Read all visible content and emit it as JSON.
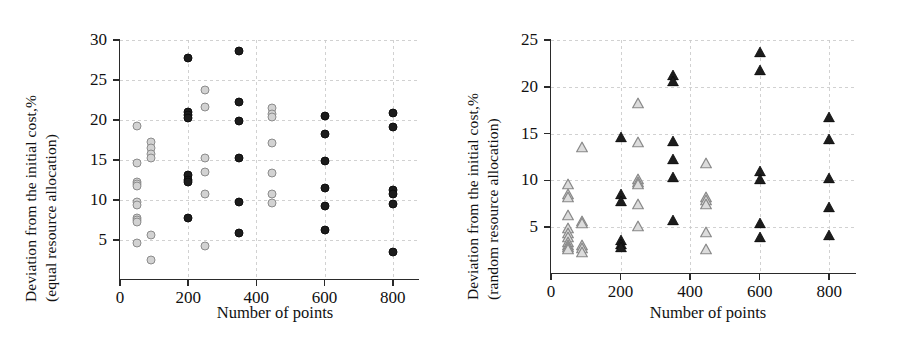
{
  "figure": {
    "panels": [
      {
        "id": "left",
        "ylabel_line1": "Deviation from the initial cost,%",
        "ylabel_line2": "(equal resource allocation)",
        "xlabel": "Number of points",
        "yticks": [
          "30",
          "25",
          "20",
          "15",
          "10",
          "5"
        ],
        "xticks": [
          "0",
          "200",
          "400",
          "600",
          "800"
        ]
      },
      {
        "id": "right",
        "ylabel_line1": "Deviation from the initial cost,%",
        "ylabel_line2": "(random resource allocation)",
        "xlabel": "Number of points",
        "yticks": [
          "25",
          "20",
          "15",
          "10",
          "5"
        ],
        "xticks": [
          "0",
          "200",
          "400",
          "600",
          "800"
        ]
      }
    ]
  },
  "chart_data": [
    {
      "type": "scatter",
      "title": "",
      "panel": "left",
      "xlabel": "Number of points",
      "ylabel": "Deviation from the initial cost,% (equal resource allocation)",
      "xlim": [
        0,
        880
      ],
      "ylim": [
        0,
        30
      ],
      "xticks": [
        0,
        200,
        400,
        600,
        800
      ],
      "yticks": [
        5,
        10,
        15,
        20,
        25,
        30
      ],
      "grid": true,
      "legend": false,
      "series": [
        {
          "name": "light-circles",
          "marker": "open-circle",
          "color": "#d2d2d2",
          "edge_color": "#8c8c8c",
          "points": [
            [
              50,
              19.2
            ],
            [
              50,
              14.6
            ],
            [
              50,
              12.3
            ],
            [
              50,
              12.0
            ],
            [
              50,
              11.8
            ],
            [
              50,
              9.7
            ],
            [
              50,
              9.4
            ],
            [
              50,
              7.8
            ],
            [
              50,
              7.5
            ],
            [
              50,
              7.3
            ],
            [
              50,
              4.6
            ],
            [
              90,
              17.2
            ],
            [
              90,
              16.5
            ],
            [
              90,
              15.8
            ],
            [
              90,
              15.3
            ],
            [
              90,
              5.6
            ],
            [
              90,
              2.5
            ],
            [
              250,
              23.8
            ],
            [
              250,
              21.6
            ],
            [
              250,
              15.3
            ],
            [
              250,
              13.5
            ],
            [
              250,
              10.7
            ],
            [
              250,
              4.2
            ],
            [
              445,
              21.5
            ],
            [
              445,
              20.7
            ],
            [
              445,
              20.4
            ],
            [
              445,
              17.1
            ],
            [
              445,
              13.4
            ],
            [
              445,
              10.7
            ],
            [
              445,
              9.6
            ]
          ]
        },
        {
          "name": "dark-circles",
          "marker": "filled-circle",
          "color": "#1c1c1c",
          "points": [
            [
              200,
              27.7
            ],
            [
              200,
              21.0
            ],
            [
              200,
              20.6
            ],
            [
              200,
              20.3
            ],
            [
              200,
              13.1
            ],
            [
              200,
              12.5
            ],
            [
              200,
              12.2
            ],
            [
              200,
              7.7
            ],
            [
              350,
              28.6
            ],
            [
              350,
              22.2
            ],
            [
              350,
              19.9
            ],
            [
              350,
              15.3
            ],
            [
              350,
              9.8
            ],
            [
              350,
              5.9
            ],
            [
              600,
              20.5
            ],
            [
              600,
              18.2
            ],
            [
              600,
              14.9
            ],
            [
              600,
              11.5
            ],
            [
              600,
              9.3
            ],
            [
              600,
              6.3
            ],
            [
              800,
              20.9
            ],
            [
              800,
              19.1
            ],
            [
              800,
              11.3
            ],
            [
              800,
              10.8
            ],
            [
              800,
              9.5
            ],
            [
              800,
              3.5
            ]
          ]
        }
      ]
    },
    {
      "type": "scatter",
      "title": "",
      "panel": "right",
      "xlabel": "Number of points",
      "ylabel": "Deviation from the initial cost,% (random resource allocation)",
      "xlim": [
        0,
        880
      ],
      "ylim": [
        0,
        25
      ],
      "xticks": [
        0,
        200,
        400,
        600,
        800
      ],
      "yticks": [
        5,
        10,
        15,
        20,
        25
      ],
      "grid": true,
      "legend": false,
      "series": [
        {
          "name": "light-triangles",
          "marker": "open-triangle",
          "color": "#d4d4d4",
          "edge_color": "#8c8c8c",
          "points": [
            [
              50,
              9.6
            ],
            [
              50,
              8.5
            ],
            [
              50,
              8.2
            ],
            [
              50,
              6.3
            ],
            [
              50,
              4.9
            ],
            [
              50,
              4.4
            ],
            [
              50,
              3.9
            ],
            [
              50,
              3.4
            ],
            [
              50,
              3.1
            ],
            [
              50,
              2.9
            ],
            [
              50,
              2.7
            ],
            [
              90,
              13.6
            ],
            [
              90,
              5.7
            ],
            [
              90,
              5.4
            ],
            [
              90,
              3.1
            ],
            [
              90,
              2.8
            ],
            [
              90,
              2.3
            ],
            [
              250,
              18.3
            ],
            [
              250,
              14.1
            ],
            [
              250,
              10.2
            ],
            [
              250,
              9.8
            ],
            [
              250,
              9.6
            ],
            [
              250,
              7.5
            ],
            [
              250,
              5.1
            ],
            [
              445,
              11.9
            ],
            [
              445,
              8.2
            ],
            [
              445,
              7.9
            ],
            [
              445,
              7.5
            ],
            [
              445,
              4.5
            ],
            [
              445,
              2.7
            ]
          ]
        },
        {
          "name": "dark-triangles",
          "marker": "filled-triangle",
          "color": "#1c1c1c",
          "points": [
            [
              200,
              14.6
            ],
            [
              200,
              8.6
            ],
            [
              200,
              7.8
            ],
            [
              200,
              3.6
            ],
            [
              200,
              3.2
            ],
            [
              200,
              2.9
            ],
            [
              350,
              21.3
            ],
            [
              350,
              20.6
            ],
            [
              350,
              14.2
            ],
            [
              350,
              12.3
            ],
            [
              350,
              10.4
            ],
            [
              350,
              5.8
            ],
            [
              600,
              23.7
            ],
            [
              600,
              21.8
            ],
            [
              600,
              11.0
            ],
            [
              600,
              10.2
            ],
            [
              600,
              5.4
            ],
            [
              600,
              3.9
            ],
            [
              800,
              16.8
            ],
            [
              800,
              14.4
            ],
            [
              800,
              10.3
            ],
            [
              800,
              7.2
            ],
            [
              800,
              4.2
            ]
          ]
        }
      ]
    }
  ]
}
